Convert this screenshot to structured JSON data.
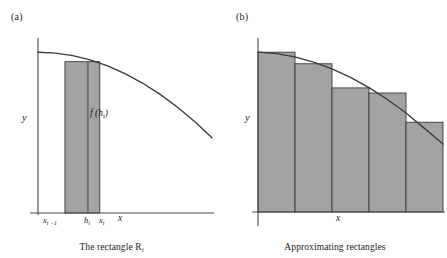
{
  "figure": {
    "background_color": "#ffffff",
    "fill_color": "#a3a3a3",
    "stroke_color": "#3b3b3b",
    "axis_color": "#4a4a4a"
  },
  "panel_a": {
    "label": "(a)",
    "caption_prefix": "The rectangle R",
    "caption_subscript": "i",
    "y_axis_label": "y",
    "x_axis_label": "x",
    "bar_value_label_prefix": "f (h",
    "bar_value_label_subscript": "i",
    "bar_value_label_suffix": ")",
    "ticks": [
      {
        "text": "x",
        "sub": "i −1"
      },
      {
        "text": "h",
        "sub": "i"
      },
      {
        "text": "x",
        "sub": "i"
      }
    ]
  },
  "panel_b": {
    "label": "(b)",
    "caption": "Approximating rectangles",
    "y_axis_label": "y",
    "x_axis_label": "x"
  },
  "chart_data": [
    {
      "type": "bar",
      "title": "The rectangle R_i",
      "subtitle": "(a)",
      "xlabel": "x",
      "ylabel": "y",
      "grid": false,
      "legend": "none",
      "axis_ranges": {
        "xlim": [
          0,
          1
        ],
        "ylim": [
          0,
          1
        ]
      },
      "curve": {
        "name": "f(x)",
        "description": "decreasing concave curve",
        "points": [
          [
            0.0,
            0.94
          ],
          [
            0.1,
            0.935
          ],
          [
            0.2,
            0.92
          ],
          [
            0.3,
            0.895
          ],
          [
            0.4,
            0.86
          ],
          [
            0.5,
            0.815
          ],
          [
            0.6,
            0.76
          ],
          [
            0.7,
            0.695
          ],
          [
            0.8,
            0.62
          ],
          [
            0.9,
            0.535
          ],
          [
            1.0,
            0.44
          ]
        ]
      },
      "categories": [
        "R_i"
      ],
      "bars": [
        {
          "label": "R_i",
          "x_left": 0.155,
          "x_right": 0.355,
          "x_mid": 0.287,
          "height": 0.885,
          "value_label": "f (h_i)",
          "left_tick": "x_{i-1}",
          "mid_tick": "h_i",
          "right_tick": "x_i"
        }
      ]
    },
    {
      "type": "bar",
      "title": "Approximating rectangles",
      "subtitle": "(b)",
      "xlabel": "x",
      "ylabel": "y",
      "grid": false,
      "legend": "none",
      "axis_ranges": {
        "xlim": [
          0,
          1
        ],
        "ylim": [
          0,
          1
        ]
      },
      "curve": {
        "name": "f(x)",
        "description": "decreasing concave curve",
        "points": [
          [
            0.0,
            0.94
          ],
          [
            0.1,
            0.932
          ],
          [
            0.2,
            0.912
          ],
          [
            0.3,
            0.882
          ],
          [
            0.4,
            0.842
          ],
          [
            0.5,
            0.792
          ],
          [
            0.6,
            0.732
          ],
          [
            0.7,
            0.662
          ],
          [
            0.8,
            0.582
          ],
          [
            0.9,
            0.492
          ],
          [
            1.0,
            0.4
          ]
        ]
      },
      "categories": [
        "1",
        "2",
        "3",
        "4",
        "5"
      ],
      "values": [
        0.94,
        0.872,
        0.73,
        0.7,
        0.528
      ],
      "bar_edges": [
        0.0,
        0.2,
        0.4,
        0.6,
        0.8,
        1.0
      ]
    }
  ]
}
